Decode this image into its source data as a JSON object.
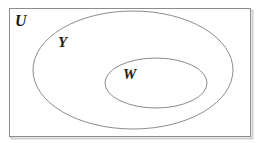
{
  "diagram": {
    "type": "venn-diagram",
    "title": "",
    "universe": {
      "label": "U",
      "shape": "rectangle",
      "x": 9,
      "y": 8,
      "width": 241,
      "height": 128,
      "stroke": "#8c8c8c",
      "fill": "#ffffff",
      "stroke_width": 1,
      "label_x": 16,
      "label_y": 14
    },
    "sets": [
      {
        "label": "Y",
        "shape": "ellipse",
        "cx": 133,
        "cy": 70,
        "rx": 100,
        "ry": 59,
        "stroke": "#8c8c8c",
        "fill": "none",
        "stroke_width": 1,
        "label_x": 59,
        "label_y": 36
      },
      {
        "label": "W",
        "shape": "ellipse",
        "cx": 156,
        "cy": 83,
        "rx": 51,
        "ry": 25,
        "stroke": "#8c8c8c",
        "fill": "none",
        "stroke_width": 1,
        "label_x": 124,
        "label_y": 68
      }
    ],
    "canvas": {
      "width": 259,
      "height": 143,
      "background": "#ffffff"
    },
    "shadow": {
      "color": "#c8c8c8",
      "offset_x": 2,
      "offset_y": 2
    }
  }
}
